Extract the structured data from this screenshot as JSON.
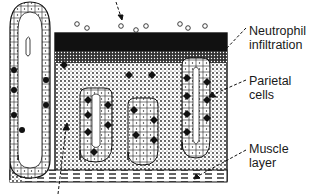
{
  "figure": {
    "colors": {
      "ink": "#111111",
      "background": "#ffffff"
    }
  },
  "labels": {
    "neutrophil": {
      "line1": "Neutrophil",
      "line2": "infiltration"
    },
    "parietal": {
      "line1": "Parietal",
      "line2": "cells"
    },
    "muscle": {
      "line1": "Muscle",
      "line2": "layer"
    }
  },
  "arrows": [
    {
      "name": "top-arrow",
      "points_to": "surface neutrophils"
    },
    {
      "name": "bottom-arrow",
      "points_to": "lamina propria"
    },
    {
      "name": "neutrophil-leader"
    },
    {
      "name": "parietal-leader"
    },
    {
      "name": "muscle-leader"
    }
  ]
}
